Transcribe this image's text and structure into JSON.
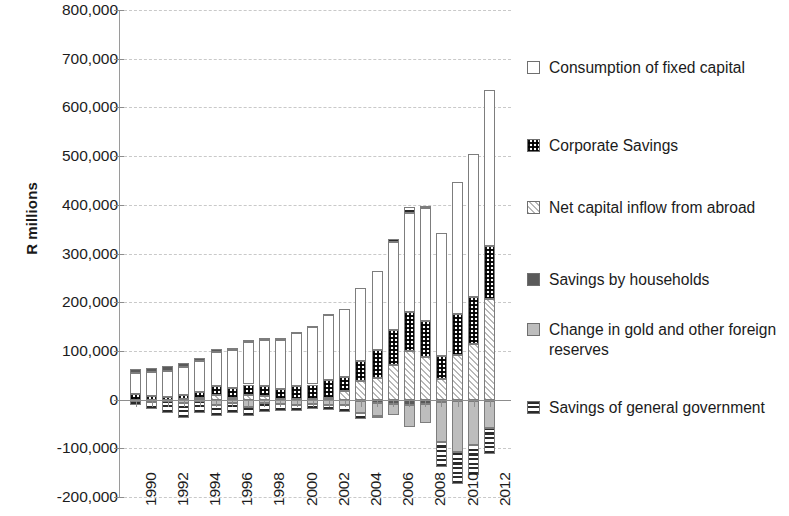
{
  "axes": {
    "ylabel": "R millions",
    "yticks": [
      "800,000",
      "700,000",
      "600,000",
      "500,000",
      "400,000",
      "300,000",
      "200,000",
      "100,000",
      "0",
      "-100,000",
      "-200,000"
    ],
    "xticks": [
      "1990",
      "1992",
      "1994",
      "1996",
      "1998",
      "2000",
      "2002",
      "2004",
      "2006",
      "2008",
      "2010",
      "2012"
    ]
  },
  "legend": {
    "items": [
      {
        "label": "Consumption of fixed capital",
        "pattern": "f-cfc",
        "icon": "legend-swatch-empty"
      },
      {
        "label": "Corporate Savings",
        "pattern": "f-corp",
        "icon": "legend-swatch-checker"
      },
      {
        "label": "Net capital inflow from abroad",
        "pattern": "f-net",
        "icon": "legend-swatch-diagonal"
      },
      {
        "label": "Savings by households",
        "pattern": "f-hh",
        "icon": "legend-swatch-solid-dark"
      },
      {
        "label": "Change in gold and other foreign reserves",
        "pattern": "f-gold",
        "icon": "legend-swatch-solid-light"
      },
      {
        "label": "Savings of general government",
        "pattern": "f-gov",
        "icon": "legend-swatch-horizontal"
      }
    ]
  },
  "chart_data": {
    "type": "bar",
    "title": "",
    "subtype": "stacked",
    "xlabel": "",
    "ylabel": "R millions",
    "ylim": [
      -200000,
      800000
    ],
    "ytick_step": 100000,
    "grid": true,
    "legend_position": "right",
    "categories": [
      1990,
      1991,
      1992,
      1993,
      1994,
      1995,
      1996,
      1997,
      1998,
      1999,
      2000,
      2001,
      2002,
      2003,
      2004,
      2005,
      2006,
      2007,
      2008,
      2009,
      2010,
      2011,
      2012
    ],
    "series": [
      {
        "name": "Consumption of fixed capital",
        "pattern": "f-cfc",
        "values": [
          43000,
          48000,
          53000,
          58000,
          64000,
          71000,
          79000,
          88000,
          95000,
          101000,
          108000,
          119000,
          133000,
          140000,
          150000,
          163000,
          181000,
          205000,
          232000,
          253000,
          272000,
          294000,
          320000
        ]
      },
      {
        "name": "Corporate Savings",
        "pattern": "f-corp",
        "values": [
          11000,
          8000,
          6000,
          8000,
          13000,
          18000,
          20000,
          22000,
          19000,
          20000,
          26000,
          30000,
          38000,
          30000,
          42000,
          57000,
          72000,
          80000,
          73000,
          46000,
          83000,
          95000,
          108000
        ]
      },
      {
        "name": "Net capital inflow from abroad",
        "pattern": "f-net",
        "values": [
          0,
          0,
          0,
          1000,
          3000,
          9000,
          3000,
          9000,
          8000,
          1000,
          2000,
          1000,
          3000,
          17000,
          38000,
          45000,
          71000,
          99000,
          88000,
          43000,
          92000,
          115000,
          207000
        ]
      },
      {
        "name": "Savings by households",
        "pattern": "f-hh",
        "values": [
          8000,
          8000,
          9000,
          8000,
          6000,
          5000,
          4000,
          4000,
          4000,
          4000,
          3000,
          2000,
          2000,
          0,
          -3000,
          -6000,
          -9000,
          -11000,
          -9000,
          -4000,
          -2000,
          -2000,
          -3000
        ]
      },
      {
        "name": "Change in gold and other foreign reserves",
        "pattern": "f-gold",
        "values": [
          -3000,
          -4000,
          -2000,
          -6000,
          -3000,
          -12000,
          -6000,
          -15000,
          -8000,
          -9000,
          -11000,
          -9000,
          -11000,
          -12000,
          -25000,
          -28000,
          -22000,
          -46000,
          -39000,
          -84000,
          -105000,
          -92000,
          -55000
        ]
      },
      {
        "name": "Savings of general government",
        "pattern": "f-gov",
        "values": [
          -9000,
          -16000,
          -26000,
          -31000,
          -24000,
          -22000,
          -21000,
          -19000,
          -18000,
          -15000,
          -12000,
          -11000,
          -10000,
          -13000,
          -12000,
          -4000,
          6000,
          12000,
          5000,
          -50000,
          -66000,
          -60000,
          -53000
        ]
      }
    ]
  }
}
